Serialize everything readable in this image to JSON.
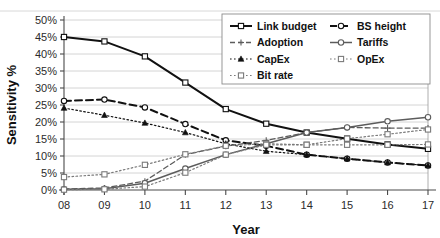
{
  "chart_data": {
    "type": "line",
    "title": "",
    "xlabel": "Year",
    "ylabel": "Sensitivity %",
    "x": [
      "08",
      "09",
      "10",
      "11",
      "12",
      "13",
      "14",
      "15",
      "16",
      "17"
    ],
    "categories": [
      "08",
      "09",
      "10",
      "11",
      "12",
      "13",
      "14",
      "15",
      "16",
      "17"
    ],
    "ylim": [
      0,
      50
    ],
    "ytick_values": [
      0,
      5,
      10,
      15,
      20,
      25,
      30,
      35,
      40,
      45,
      50
    ],
    "ytick_labels": [
      "0%",
      "5%",
      "10%",
      "15%",
      "20%",
      "25%",
      "30%",
      "35%",
      "40%",
      "45%",
      "50%"
    ],
    "grid": true,
    "legend_position": "top-right",
    "series": [
      {
        "name": "Link budget",
        "values": [
          45.0,
          43.7,
          39.3,
          31.6,
          23.8,
          19.5,
          16.9,
          15.1,
          13.4,
          12.1
        ],
        "color": "#111111",
        "line_style": "solid",
        "marker": "square-open",
        "line_width": 2.0
      },
      {
        "name": "BS height",
        "values": [
          26.2,
          26.6,
          24.3,
          19.4,
          14.6,
          13.0,
          10.4,
          9.2,
          8.1,
          7.2
        ],
        "color": "#111111",
        "line_style": "dashed",
        "marker": "circle-open",
        "line_width": 2.0
      },
      {
        "name": "Adoption",
        "values": [
          0.3,
          0.6,
          2.6,
          10.4,
          12.9,
          14.6,
          16.9,
          18.4,
          18.2,
          18.2
        ],
        "color": "#5c5c5c",
        "line_style": "dashed",
        "marker": "plus",
        "line_width": 1.3
      },
      {
        "name": "Tariffs",
        "values": [
          0.2,
          0.4,
          2.0,
          6.3,
          10.4,
          13.6,
          16.9,
          18.4,
          20.2,
          21.4
        ],
        "color": "#5c5c5c",
        "line_style": "solid",
        "marker": "circle-open",
        "line_width": 1.5
      },
      {
        "name": "CapEx",
        "values": [
          24.1,
          22.0,
          19.7,
          16.9,
          13.6,
          11.4,
          10.4,
          9.2,
          8.1,
          7.2
        ],
        "color": "#111111",
        "line_style": "dotted",
        "marker": "triangle-filled",
        "line_width": 1.2
      },
      {
        "name": "OpEx",
        "values": [
          3.8,
          4.6,
          7.4,
          10.5,
          13.0,
          13.6,
          13.3,
          15.1,
          16.4,
          17.8
        ],
        "color": "#7a7a7a",
        "line_style": "dotted",
        "marker": "square-open",
        "line_width": 1.2
      },
      {
        "name": "Bit rate",
        "values": [
          0.1,
          0.2,
          1.0,
          5.1,
          10.4,
          13.3,
          13.3,
          13.3,
          13.3,
          13.4
        ],
        "color": "#7a7a7a",
        "line_style": "dotted",
        "marker": "square-open",
        "line_width": 1.2
      }
    ],
    "legend_columns": [
      [
        "Link budget",
        "Adoption",
        "CapEx",
        "Bit rate"
      ],
      [
        "BS height",
        "Tariffs",
        "OpEx"
      ]
    ]
  }
}
